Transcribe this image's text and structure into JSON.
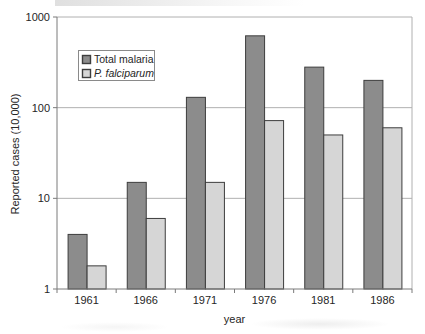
{
  "chart_data": {
    "type": "bar",
    "title": "",
    "xlabel": "year",
    "ylabel": "Reported cases (10,000)",
    "yscale": "log",
    "ylim": [
      1,
      1000
    ],
    "yticks": [
      1,
      10,
      100,
      1000
    ],
    "grid": true,
    "legend_position": "upper-left",
    "categories": [
      "1961",
      "1966",
      "1971",
      "1976",
      "1981",
      "1986"
    ],
    "series": [
      {
        "name": "Total malaria",
        "color": "#8c8c8c",
        "italic": false,
        "values": [
          4,
          15,
          130,
          620,
          280,
          200
        ]
      },
      {
        "name": "P. falciparum",
        "color": "#d6d6d6",
        "italic": true,
        "values": [
          1.8,
          6,
          15,
          72,
          50,
          60
        ]
      }
    ]
  },
  "style": {
    "background": "#ffffff",
    "grid_color": "#b0b0b0",
    "axis_color": "#7a7a7a",
    "bar_edge_color": "#3d3d3d",
    "text_color": "#262626",
    "legend_border_color": "#8a8a8a",
    "legend_fill": "#ffffff"
  }
}
